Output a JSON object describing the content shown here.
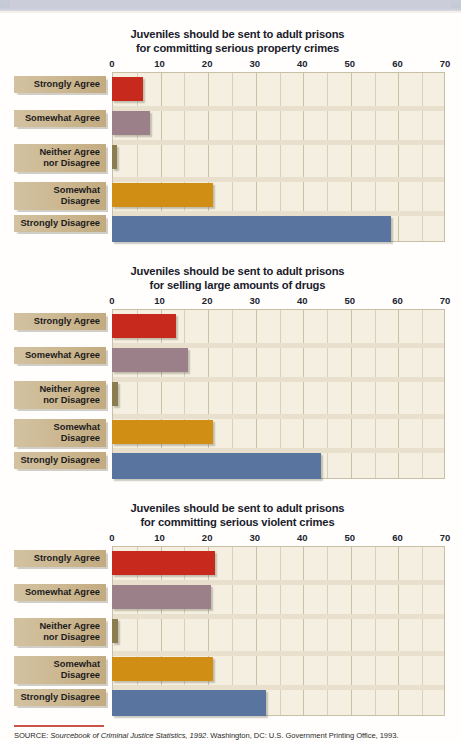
{
  "page": {
    "background_color": "#fffefc",
    "source_rule_color": "#c8544a"
  },
  "source": {
    "prefix": "SOURCE: ",
    "italic_part": "Sourcebook of Criminal Justice Statistics, 1992",
    "rest": ". Washington, DC: U.S. Government Printing Office, 1993."
  },
  "palette": {
    "strongly_agree": "#c8291d",
    "somewhat_agree": "#9b8089",
    "neither": "#8a7d4f",
    "somewhat_disagree": "#d08e14",
    "strongly_disagree": "#5a74a0",
    "label_box": "#cbb68f",
    "plot_background": "#f4efe1",
    "grid": "#d9d0b9",
    "axis_text": "#1b2330"
  },
  "chart_data": [
    {
      "type": "bar",
      "orientation": "horizontal",
      "title": "Juveniles should be sent to adult prisons",
      "subtitle": "for committing serious property crimes",
      "xlabel": "",
      "ylabel": "",
      "xlim": [
        0,
        70
      ],
      "ticks": [
        0,
        10,
        20,
        30,
        40,
        50,
        60,
        70
      ],
      "grid": true,
      "legend": "none",
      "categories": [
        "Strongly Agree",
        "Somewhat Agree",
        "Neither Agree\nnor Disagree",
        "Somewhat Disagree",
        "Strongly Disagree"
      ],
      "values": [
        6.5,
        8,
        1,
        21.3,
        58.7
      ],
      "colors": [
        "#c8291d",
        "#9b8089",
        "#8a7d4f",
        "#d08e14",
        "#5a74a0"
      ]
    },
    {
      "type": "bar",
      "orientation": "horizontal",
      "title": "Juveniles should be sent to adult prisons",
      "subtitle": "for selling large amounts of drugs",
      "xlabel": "",
      "ylabel": "",
      "xlim": [
        0,
        70
      ],
      "ticks": [
        0,
        10,
        20,
        30,
        40,
        50,
        60,
        70
      ],
      "grid": true,
      "legend": "none",
      "categories": [
        "Strongly Agree",
        "Somewhat Agree",
        "Neither Agree\nnor Disagree",
        "Somewhat Disagree",
        "Strongly Disagree"
      ],
      "values": [
        13.5,
        16,
        1.3,
        21.3,
        44
      ],
      "colors": [
        "#c8291d",
        "#9b8089",
        "#8a7d4f",
        "#d08e14",
        "#5a74a0"
      ]
    },
    {
      "type": "bar",
      "orientation": "horizontal",
      "title": "Juveniles should be sent to adult prisons",
      "subtitle": "for committing serious violent crimes",
      "xlabel": "",
      "ylabel": "",
      "xlim": [
        0,
        70
      ],
      "ticks": [
        0,
        10,
        20,
        30,
        40,
        50,
        60,
        70
      ],
      "grid": true,
      "legend": "none",
      "categories": [
        "Strongly Agree",
        "Somewhat Agree",
        "Neither Agree\nnor Disagree",
        "Somewhat Disagree",
        "Strongly Disagree"
      ],
      "values": [
        21.7,
        20.8,
        1.3,
        21.3,
        32.4
      ],
      "colors": [
        "#c8291d",
        "#9b8089",
        "#8a7d4f",
        "#d08e14",
        "#5a74a0"
      ]
    }
  ]
}
